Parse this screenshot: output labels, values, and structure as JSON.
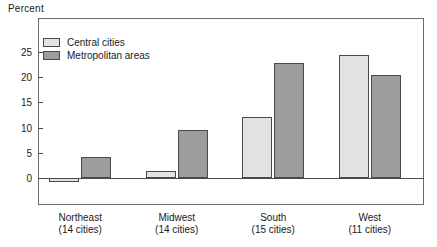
{
  "chart_data": {
    "type": "bar",
    "title": "",
    "ylabel": "Percent",
    "xlabel": "",
    "grid": false,
    "legend_position": "top-left inside plot",
    "ylim": [
      -2.5,
      28
    ],
    "yticks": [
      0,
      5,
      10,
      15,
      20,
      25
    ],
    "ytick_labels": [
      "0",
      "5",
      "10",
      "15",
      "20",
      "25"
    ],
    "categories": [
      "Northeast",
      "Midwest",
      "South",
      "West"
    ],
    "category_sublabels": [
      "(14 cities)",
      "(14 cities)",
      "(15 cities)",
      "(11 cities)"
    ],
    "series": [
      {
        "name": "Central cities",
        "color": "#e2e2e2",
        "values": [
          -0.8,
          1.4,
          12.1,
          24.4
        ]
      },
      {
        "name": "Metropolitan areas",
        "color": "#9d9d9d",
        "values": [
          4.2,
          9.6,
          22.8,
          20.3
        ]
      }
    ]
  },
  "legend": {
    "items": [
      {
        "label": "Central cities",
        "swatch": "light-gray-swatch"
      },
      {
        "label": "Metropolitan areas",
        "swatch": "dark-gray-swatch"
      }
    ]
  },
  "axis": {
    "y_axis_title": "Percent"
  },
  "colors": {
    "central_cities": "#e2e2e2",
    "metropolitan_areas": "#9d9d9d",
    "axis": "#4a4a4a",
    "frame": "#6b6b6b",
    "text": "#1a1a1a"
  }
}
